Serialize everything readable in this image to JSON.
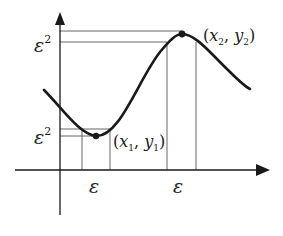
{
  "diagram": {
    "labels": {
      "eps_sq_top": "ε",
      "eps_sq_bottom": "ε",
      "superscript": "2",
      "eps_x_left": "ε",
      "eps_x_right": "ε",
      "point_min": {
        "open": "(",
        "x": "x",
        "xsub": "1",
        "comma": ", ",
        "y": "y",
        "ysub": "1",
        "close": ")"
      },
      "point_max": {
        "open": "(",
        "x": "x",
        "xsub": "2",
        "comma": ", ",
        "y": "y",
        "ysub": "2",
        "close": ")"
      }
    },
    "colors": {
      "curve": "#1a1a1a",
      "axis": "#1a1a1a",
      "guide": "#555555"
    }
  }
}
